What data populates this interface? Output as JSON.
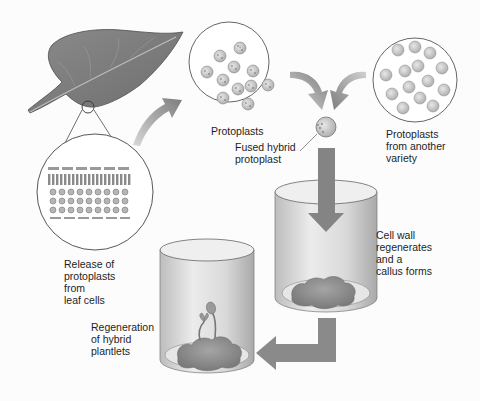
{
  "labels": {
    "protoplasts": "Protoplasts",
    "fused_hybrid": "Fused hybrid\nprotoplast",
    "another_variety": "Protoplasts\nfrom another\nvariety",
    "release": "Release of\nprotoplasts\nfrom\nleaf cells",
    "cell_wall": "Cell wall\nregenerates\nand a\ncallus forms",
    "regeneration": "Regeneration\nof hybrid\nplantlets"
  },
  "elements": {
    "leaf": "leaf",
    "leaf_cross_section": "magnified leaf cross-section",
    "protoplast_dish_1": "protoplasts (spotted)",
    "protoplast_dish_2": "protoplasts from another variety (plain)",
    "fused_protoplast": "fused hybrid protoplast",
    "culture_vessel_1": "culture vessel with callus",
    "culture_vessel_2": "culture vessel with plantlets"
  },
  "colors": {
    "leaf": "#7a7a7a",
    "arrow": "#8a8a8a",
    "vessel": "#d6d6d6",
    "callus": "#8c8c8c"
  }
}
